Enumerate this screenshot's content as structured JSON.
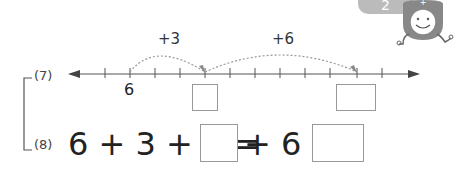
{
  "page_tab": "2",
  "problems": [
    {
      "number": "(7)",
      "number_line": {
        "start_label": "6",
        "jumps": [
          {
            "label": "+3"
          },
          {
            "label": "+6"
          }
        ],
        "answer_boxes": 2
      }
    },
    {
      "number": "(8)",
      "equation": {
        "parts": [
          "6",
          "+",
          "3",
          "+",
          "6",
          "=",
          "",
          "+",
          "6",
          "=",
          ""
        ]
      }
    }
  ],
  "colors": {
    "line": "#555555",
    "dotted_arc": "#999999",
    "box_border": "#999999",
    "tab": "#bbbbbb"
  }
}
